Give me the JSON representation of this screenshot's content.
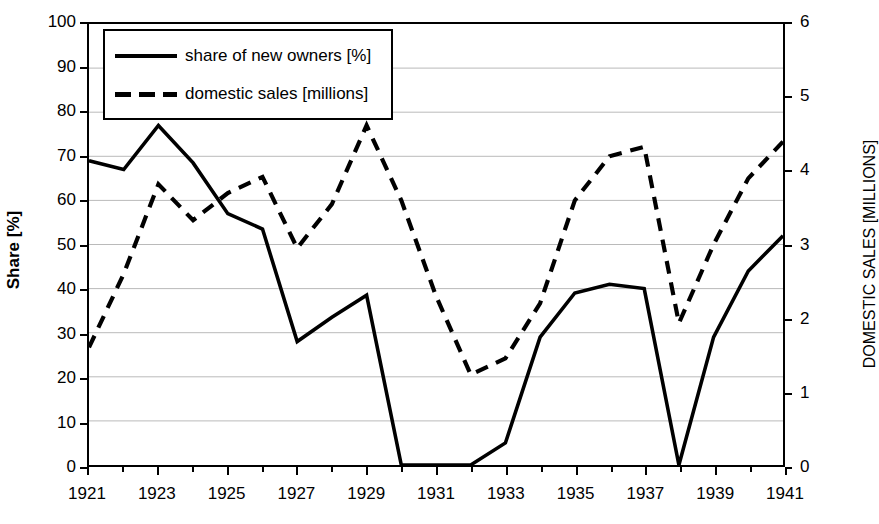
{
  "chart_data": {
    "type": "line",
    "title": "",
    "xlabel": "",
    "ylabel": "Share [%]",
    "y2label": "DOMESTIC SALES [MILLIONS]",
    "grid": true,
    "legend_position": "top-left",
    "xlim": [
      1921,
      1941
    ],
    "ylim": [
      0,
      100
    ],
    "y2lim": [
      0,
      6
    ],
    "yticks": [
      0,
      10,
      20,
      30,
      40,
      50,
      60,
      70,
      80,
      90,
      100
    ],
    "y2ticks": [
      0,
      1,
      2,
      3,
      4,
      5,
      6
    ],
    "xticks": [
      1921,
      1923,
      1925,
      1927,
      1929,
      1931,
      1933,
      1935,
      1937,
      1939,
      1941
    ],
    "xtick_labels": [
      "1921",
      "1923",
      "1925",
      "1927",
      "1929",
      "1931",
      "1933",
      "1935",
      "1937",
      "1939",
      "1941"
    ],
    "ytick_labels": [
      "0",
      "10",
      "20",
      "30",
      "40",
      "50",
      "60",
      "70",
      "80",
      "90",
      "100"
    ],
    "y2tick_labels": [
      "0",
      "1",
      "2",
      "3",
      "4",
      "5",
      "6"
    ],
    "x": [
      1921,
      1922,
      1923,
      1924,
      1925,
      1926,
      1927,
      1928,
      1929,
      1930,
      1931,
      1932,
      1933,
      1934,
      1935,
      1936,
      1937,
      1938,
      1939,
      1940,
      1941
    ],
    "series": [
      {
        "name": "share of new owners [%]",
        "axis": "left",
        "style": "solid",
        "color": "#000000",
        "unit": "%",
        "values": [
          69,
          67,
          77,
          68.5,
          57,
          53.5,
          28,
          33.5,
          38.5,
          0,
          0,
          0,
          5,
          29,
          39,
          41,
          40,
          0,
          29,
          44,
          52
        ]
      },
      {
        "name": "domestic sales [millions]",
        "axis": "right",
        "style": "dashed",
        "color": "#000000",
        "unit": "millions",
        "values": [
          1.6,
          2.6,
          3.82,
          3.33,
          3.7,
          3.92,
          2.95,
          3.55,
          4.62,
          3.6,
          2.3,
          1.23,
          1.45,
          2.2,
          3.6,
          4.2,
          4.33,
          1.93,
          3.0,
          3.9,
          4.4
        ]
      }
    ]
  },
  "legend": {
    "items": [
      {
        "label": "share of new owners [%]",
        "style": "solid"
      },
      {
        "label": "domestic sales [millions]",
        "style": "dashed"
      }
    ]
  }
}
